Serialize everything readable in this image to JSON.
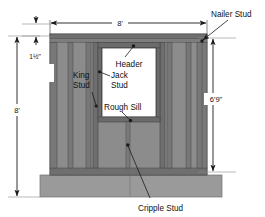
{
  "diagram": {
    "type": "architectural-framing-elevation",
    "colors": {
      "stud_face": "#8c8c8c",
      "stud_edge": "#5e5e5e",
      "plate": "#6b6b6b",
      "floor": "#9a9a9a",
      "opening": "#ffffff",
      "line": "#1a1a1a",
      "text": "#111111"
    },
    "labels": {
      "nailer_stud": "Nailer Stud",
      "header": "Header",
      "jack_stud_line1": "Jack",
      "jack_stud_line2": "Stud",
      "king_stud_line1": "King",
      "king_stud_line2": "Stud",
      "rough_sill": "Rough Sill",
      "cripple_stud": "Cripple Stud"
    },
    "dimensions": {
      "wall_width": "8'",
      "top_plate_thickness": "1½\"",
      "wall_height": "8'",
      "opening_height": "6'9\""
    }
  }
}
